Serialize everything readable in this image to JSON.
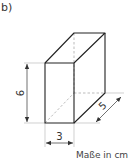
{
  "part_label": "b)",
  "figure": {
    "type": "cuboid",
    "dimensions": {
      "height": "6",
      "width": "3",
      "depth": "5"
    },
    "units_caption": "Maße in cm",
    "colors": {
      "edge": "#222222",
      "hidden_edge": "#aaaaaa",
      "dimension_line": "#333333",
      "extension_line": "#bbbbbb"
    }
  }
}
